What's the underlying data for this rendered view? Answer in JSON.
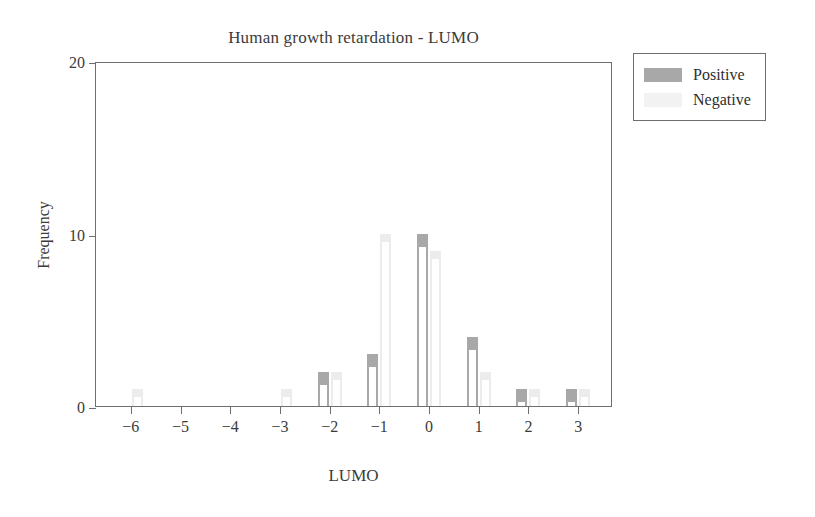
{
  "chart_data": {
    "type": "bar",
    "title": "Human growth retardation - LUMO",
    "xlabel": "LUMO",
    "ylabel": "Frequency",
    "categories": [
      "−6",
      "−5",
      "−4",
      "−3",
      "−2",
      "−1",
      "0",
      "1",
      "2",
      "3"
    ],
    "x_tick_labels": [
      "−6",
      "−5",
      "−4",
      "−3",
      "−2",
      "−1",
      "0",
      "1",
      "2",
      "3"
    ],
    "y_tick_labels": [
      "0",
      "10",
      "20"
    ],
    "y_ticks": [
      0,
      10,
      20
    ],
    "xlim": [
      -6.7,
      3.7
    ],
    "ylim": [
      0,
      20
    ],
    "grid": false,
    "legend_position": "outside-top-right",
    "series": [
      {
        "name": "Positive",
        "color": "#a8a8a8",
        "values": [
          0,
          0,
          0,
          0,
          2,
          3,
          10,
          4,
          1,
          1
        ]
      },
      {
        "name": "Negative",
        "color": "#f2f2f2",
        "values": [
          1,
          0,
          0,
          1,
          2,
          10,
          9,
          2,
          1,
          1
        ]
      }
    ]
  },
  "legend": {
    "entries": [
      {
        "label": "Positive",
        "swatch": "positive"
      },
      {
        "label": "Negative",
        "swatch": "negative"
      }
    ]
  }
}
